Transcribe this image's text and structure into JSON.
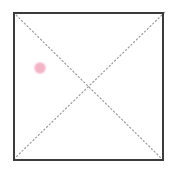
{
  "canvas": {
    "width": 175,
    "height": 176,
    "background_color": "#ffffff"
  },
  "shapes": {
    "square": {
      "name": "bounding-square",
      "x": 13,
      "y": 12,
      "width": 151,
      "height": 149,
      "stroke_color": "#3b3b3b",
      "stroke_width": 2,
      "fill_color": "#ffffff"
    },
    "diagonals": {
      "name": "dotted-diagonals",
      "stroke_color": "#9a9a9a",
      "stroke_width": 1.2,
      "dash_pattern": "1.2 2.6",
      "lines": [
        {
          "label": "diagonal-tl-br",
          "x1": 13,
          "y1": 12,
          "x2": 164,
          "y2": 161
        },
        {
          "label": "diagonal-tr-bl",
          "x1": 164,
          "y1": 12,
          "x2": 13,
          "y2": 161
        }
      ],
      "intersection": {
        "x": 88,
        "y": 86
      }
    },
    "marker_dot": {
      "name": "pink-marker-dot",
      "cx": 40,
      "cy": 68,
      "r": 6,
      "fill_color": "#f5b3c8",
      "edge_color": "#fbd9e4"
    }
  },
  "labels": {
    "title": "",
    "annotations": []
  },
  "colors": {
    "background": "#ffffff",
    "border": "#3b3b3b",
    "diagonal": "#9a9a9a",
    "marker": "#f5b3c8"
  }
}
